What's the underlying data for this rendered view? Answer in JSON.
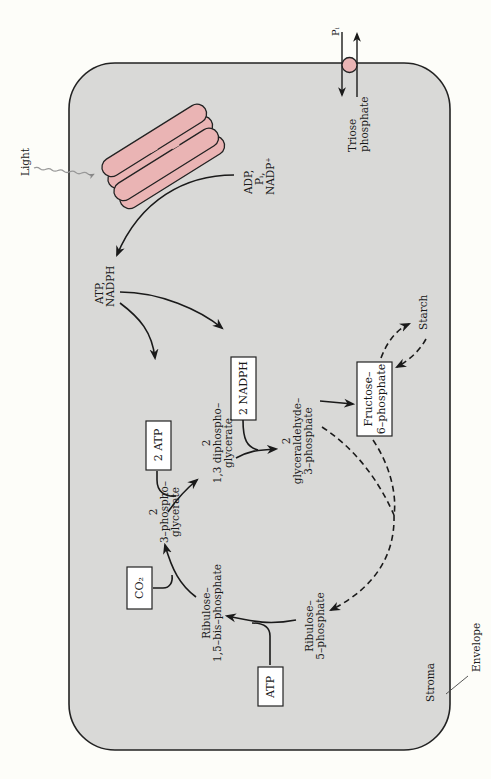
{
  "diagram": {
    "colors": {
      "stroma_fill": "#d9d9d7",
      "envelope_stroke": "#222222",
      "thylakoid_fill": "#eab4b4",
      "transporter_fill": "#eab4b4",
      "box_fill": "#ffffff",
      "background": "#fdfdf9"
    },
    "labels": {
      "light": "Light",
      "pi_out": "Pᵢ",
      "triose_1": "Triose",
      "triose_2": "phosphate",
      "adp_1": "ADP,",
      "adp_2": "Pᵢ,",
      "adp_3": "NADP⁺",
      "atp_nadph_1": "ATP,",
      "atp_nadph_2": "NADPH",
      "dpg_1": "2",
      "dpg_2": "1,3 diphospho–",
      "dpg_3": "glycerate",
      "gap_1": "2",
      "gap_2": "glyceraldehyde–",
      "gap_3": "3–phosphate",
      "pga_1": "2",
      "pga_2": "3–phospho–",
      "pga_3": "glycerate",
      "rubp_1": "Ribulose–",
      "rubp_2": "1,5–bis–phosphate",
      "ru5p_1": "Ribulose–",
      "ru5p_2": "5–phosphate",
      "starch": "Starch",
      "stroma": "Stroma",
      "envelope": "Envelope"
    },
    "boxes": {
      "nadph": "2 NADPH",
      "atp2": "2 ATP",
      "f6p_1": "Fructose–",
      "f6p_2": "6–phosphate",
      "co2": "CO₂",
      "atp": "ATP"
    }
  }
}
